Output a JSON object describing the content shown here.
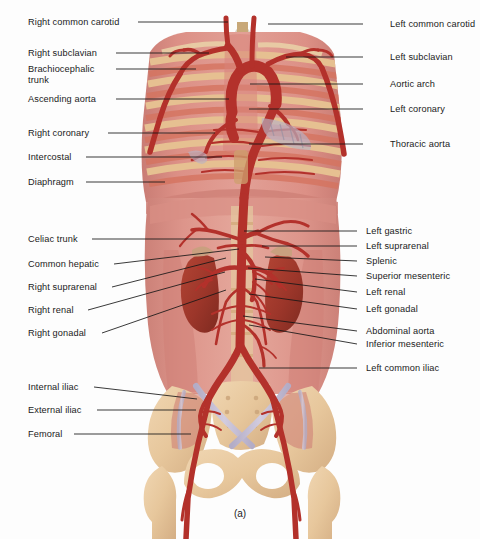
{
  "figure": {
    "caption": "(a)",
    "background": "#fdfdfd",
    "width": 480,
    "height": 539
  },
  "palette": {
    "leader_line": "#171717",
    "label_text": "#1b1b1b",
    "artery_red": "#b3312b",
    "artery_red_light": "#c9443a",
    "torso_rose": "#d98b84",
    "torso_rose_dark": "#c4736c",
    "muscle_salmon": "#d4735f",
    "rib_tan": "#e0b88a",
    "bone_tan": "#e8c9a0",
    "bone_tan_dark": "#d9b281",
    "kidney_brick": "#a03a2e",
    "vein_lilac": "#c9c3d8",
    "trachea_gray": "#cfc9bd",
    "liver_mauve": "#cf8178"
  },
  "labels_left": [
    {
      "id": "right-common-carotid",
      "text": "Right common carotid",
      "x": 28,
      "y": 17,
      "leader": {
        "x1": 138,
        "y1": 22,
        "x2": 228,
        "y2": 22
      }
    },
    {
      "id": "right-subclavian",
      "text": "Right subclavian",
      "x": 28,
      "y": 48,
      "leader": {
        "x1": 116,
        "y1": 53,
        "x2": 209,
        "y2": 53
      }
    },
    {
      "id": "brachiocephalic-trunk",
      "text": "Brachiocephalic\ntrunk",
      "x": 28,
      "y": 64,
      "leader": {
        "x1": 116,
        "y1": 69,
        "x2": 196,
        "y2": 69
      }
    },
    {
      "id": "ascending-aorta",
      "text": "Ascending aorta",
      "x": 28,
      "y": 94,
      "leader": {
        "x1": 116,
        "y1": 99,
        "x2": 229,
        "y2": 99
      }
    },
    {
      "id": "right-coronary",
      "text": "Right coronary",
      "x": 28,
      "y": 128,
      "leader": {
        "x1": 108,
        "y1": 133,
        "x2": 215,
        "y2": 133
      }
    },
    {
      "id": "intercostal",
      "text": "Intercostal",
      "x": 28,
      "y": 152,
      "leader": {
        "x1": 86,
        "y1": 157,
        "x2": 222,
        "y2": 157
      }
    },
    {
      "id": "diaphragm",
      "text": "Diaphragm",
      "x": 28,
      "y": 177,
      "leader": {
        "x1": 86,
        "y1": 182,
        "x2": 165,
        "y2": 182
      }
    },
    {
      "id": "celiac-trunk",
      "text": "Celiac trunk",
      "x": 28,
      "y": 234,
      "leader": {
        "x1": 92,
        "y1": 239,
        "x2": 231,
        "y2": 239
      }
    },
    {
      "id": "common-hepatic",
      "text": "Common hepatic",
      "x": 28,
      "y": 259,
      "leader": {
        "x1": 114,
        "y1": 264,
        "x2": 239,
        "y2": 249
      }
    },
    {
      "id": "right-suprarenal",
      "text": "Right suprarenal",
      "x": 28,
      "y": 282,
      "leader": {
        "x1": 112,
        "y1": 287,
        "x2": 226,
        "y2": 258
      }
    },
    {
      "id": "right-renal",
      "text": "Right renal",
      "x": 28,
      "y": 305,
      "leader": {
        "x1": 88,
        "y1": 310,
        "x2": 225,
        "y2": 272
      }
    },
    {
      "id": "right-gonadal",
      "text": "Right gonadal",
      "x": 28,
      "y": 328,
      "leader": {
        "x1": 102,
        "y1": 333,
        "x2": 226,
        "y2": 290
      }
    },
    {
      "id": "internal-iliac",
      "text": "Internal iliac",
      "x": 28,
      "y": 382,
      "leader": {
        "x1": 94,
        "y1": 387,
        "x2": 197,
        "y2": 399
      }
    },
    {
      "id": "external-iliac",
      "text": "External iliac",
      "x": 28,
      "y": 405,
      "leader": {
        "x1": 97,
        "y1": 410,
        "x2": 196,
        "y2": 410
      }
    },
    {
      "id": "femoral",
      "text": "Femoral",
      "x": 28,
      "y": 429,
      "leader": {
        "x1": 74,
        "y1": 434,
        "x2": 191,
        "y2": 434
      }
    }
  ],
  "labels_right": [
    {
      "id": "left-common-carotid",
      "text": "Left common carotid",
      "x": 390,
      "y": 19,
      "leader": {
        "x1": 363,
        "y1": 24,
        "x2": 268,
        "y2": 24
      }
    },
    {
      "id": "left-subclavian",
      "text": "Left subclavian",
      "x": 390,
      "y": 52,
      "leader": {
        "x1": 363,
        "y1": 57,
        "x2": 286,
        "y2": 57
      }
    },
    {
      "id": "aortic-arch",
      "text": "Aortic arch",
      "x": 390,
      "y": 79,
      "leader": {
        "x1": 363,
        "y1": 84,
        "x2": 250,
        "y2": 84
      }
    },
    {
      "id": "left-coronary",
      "text": "Left coronary",
      "x": 390,
      "y": 104,
      "leader": {
        "x1": 363,
        "y1": 109,
        "x2": 249,
        "y2": 109
      }
    },
    {
      "id": "thoracic-aorta",
      "text": "Thoracic aorta",
      "x": 390,
      "y": 139,
      "leader": {
        "x1": 363,
        "y1": 144,
        "x2": 249,
        "y2": 144
      }
    },
    {
      "id": "left-gastric",
      "text": "Left gastric",
      "x": 366,
      "y": 226,
      "leader": {
        "x1": 357,
        "y1": 231,
        "x2": 244,
        "y2": 231
      }
    },
    {
      "id": "left-suprarenal",
      "text": "Left suprarenal",
      "x": 366,
      "y": 241,
      "leader": {
        "x1": 357,
        "y1": 246,
        "x2": 262,
        "y2": 246
      }
    },
    {
      "id": "splenic",
      "text": "Splenic",
      "x": 366,
      "y": 256,
      "leader": {
        "x1": 357,
        "y1": 261,
        "x2": 265,
        "y2": 257
      }
    },
    {
      "id": "superior-mesenteric",
      "text": "Superior mesenteric",
      "x": 366,
      "y": 271,
      "leader": {
        "x1": 357,
        "y1": 276,
        "x2": 248,
        "y2": 268
      }
    },
    {
      "id": "left-renal",
      "text": "Left renal",
      "x": 366,
      "y": 287,
      "leader": {
        "x1": 357,
        "y1": 292,
        "x2": 255,
        "y2": 279
      }
    },
    {
      "id": "left-gonadal",
      "text": "Left gonadal",
      "x": 366,
      "y": 304,
      "leader": {
        "x1": 357,
        "y1": 309,
        "x2": 249,
        "y2": 294
      }
    },
    {
      "id": "abdominal-aorta",
      "text": "Abdominal aorta",
      "x": 366,
      "y": 326,
      "leader": {
        "x1": 357,
        "y1": 331,
        "x2": 243,
        "y2": 316
      }
    },
    {
      "id": "inferior-mesenteric",
      "text": "Inferior mesenteric",
      "x": 366,
      "y": 339,
      "leader": {
        "x1": 357,
        "y1": 344,
        "x2": 249,
        "y2": 325
      }
    },
    {
      "id": "left-common-iliac",
      "text": "Left common iliac",
      "x": 366,
      "y": 363,
      "leader": {
        "x1": 357,
        "y1": 368,
        "x2": 259,
        "y2": 368
      }
    }
  ]
}
